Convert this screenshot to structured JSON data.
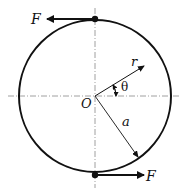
{
  "diagram": {
    "type": "ring with diametrically opposed tangential forces",
    "labels": {
      "force_top": "F",
      "force_bottom": "F",
      "origin": "O",
      "radial_coord": "r",
      "angle": "θ",
      "radius": "a"
    },
    "colors": {
      "stroke": "#111111",
      "centerline": "#888888",
      "background": "#ffffff"
    },
    "geometry": {
      "center": [
        95,
        96
      ],
      "radius": 76,
      "r_angle_deg": 30,
      "a_angle_deg": -55
    }
  }
}
